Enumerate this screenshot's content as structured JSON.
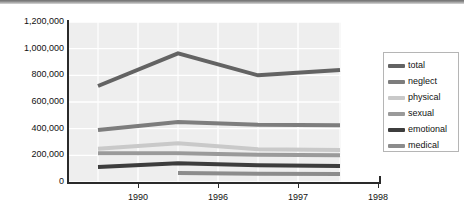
{
  "chart_data": {
    "type": "line",
    "title": "",
    "xlabel": "",
    "ylabel": "",
    "ylim": [
      0,
      1200000
    ],
    "yticks": [
      0,
      200000,
      400000,
      600000,
      800000,
      1000000,
      1200000
    ],
    "ytick_labels": [
      "0",
      "200,000",
      "400,000",
      "600,000",
      "800,000",
      "1,000,000",
      "1,200,000"
    ],
    "xtick_labels": [
      "1990",
      "1996",
      "1997",
      "1998"
    ],
    "xticks": [
      1990,
      1996,
      1997,
      1998
    ],
    "x": [
      1989,
      1993,
      1996,
      1997
    ],
    "grid": true,
    "legend_position": "right",
    "plot_background": "#eeeeee",
    "gridline_color": "#ffffff",
    "series": [
      {
        "name": "total",
        "color": "#636363",
        "x": [
          1989,
          1993,
          1996,
          1997
        ],
        "values": [
          720000,
          965000,
          800000,
          840000
        ]
      },
      {
        "name": "neglect",
        "color": "#7d7d7d",
        "x": [
          1989,
          1993,
          1996,
          1997
        ],
        "values": [
          390000,
          450000,
          430000,
          425000
        ]
      },
      {
        "name": "physical",
        "color": "#c9c9c9",
        "x": [
          1989,
          1993,
          1996,
          1997
        ],
        "values": [
          250000,
          290000,
          245000,
          240000
        ]
      },
      {
        "name": "sexual",
        "color": "#9a9a9a",
        "x": [
          1989,
          1993,
          1996,
          1997
        ],
        "values": [
          215000,
          215000,
          205000,
          200000
        ]
      },
      {
        "name": "emotional",
        "color": "#3d3d3d",
        "x": [
          1989,
          1993,
          1996,
          1997
        ],
        "values": [
          112000,
          140000,
          125000,
          120000
        ]
      },
      {
        "name": "medical",
        "color": "#8c8c8c",
        "x": [
          1993,
          1996,
          1997
        ],
        "values": [
          68000,
          62000,
          60000
        ]
      }
    ]
  },
  "legend": {
    "items": [
      {
        "label": "total",
        "color": "#636363"
      },
      {
        "label": "neglect",
        "color": "#7d7d7d"
      },
      {
        "label": "physical",
        "color": "#c9c9c9"
      },
      {
        "label": "sexual",
        "color": "#9a9a9a"
      },
      {
        "label": "emotional",
        "color": "#3d3d3d"
      },
      {
        "label": "medical",
        "color": "#8c8c8c"
      }
    ]
  }
}
